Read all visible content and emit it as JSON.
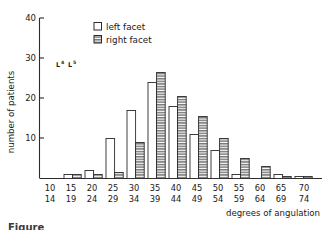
{
  "figure": {
    "background": "#ffffff",
    "ink_color": "#1a1a1a",
    "caption_fragment": "Figure"
  },
  "legend": {
    "position": "top-left-inner",
    "entries": [
      {
        "label": "left facet",
        "swatch": "open-square",
        "fill": "#ffffff"
      },
      {
        "label": "right facet",
        "swatch": "hatched-square",
        "fill": "#808080"
      }
    ]
  },
  "annotation": {
    "text": "L4 L5",
    "parts": [
      {
        "base": "L",
        "sup": "4"
      },
      {
        "base": "L",
        "sup": "5"
      }
    ]
  },
  "axes": {
    "y": {
      "label": "number of patients",
      "ticks": [
        10,
        20,
        30,
        40
      ],
      "tick_labels": [
        "10",
        "20",
        "30",
        "40"
      ],
      "min": 0,
      "max": 40
    },
    "x": {
      "label": "degrees of angulation",
      "tick_labels_top": [
        "10",
        "15",
        "20",
        "25",
        "30",
        "35",
        "40",
        "45",
        "50",
        "55",
        "60",
        "65",
        "70"
      ],
      "tick_labels_bottom": [
        "14",
        "19",
        "24",
        "29",
        "34",
        "39",
        "44",
        "49",
        "54",
        "59",
        "64",
        "69",
        "74"
      ]
    }
  },
  "chart_data": {
    "type": "bar",
    "title": "",
    "subtitle": "",
    "xlabel": "degrees of angulation",
    "ylabel": "number of patients",
    "ylim": [
      0,
      40
    ],
    "yticks": [
      10,
      20,
      30,
      40
    ],
    "grid": false,
    "legend_position": "upper left (inside axes)",
    "categories": [
      "10-14",
      "15-19",
      "20-24",
      "25-29",
      "30-34",
      "35-39",
      "40-44",
      "45-49",
      "50-54",
      "55-59",
      "60-64",
      "65-69",
      "70-74"
    ],
    "series": [
      {
        "name": "left facet",
        "fill": "#ffffff",
        "values": [
          0,
          1,
          2,
          10,
          17,
          24,
          18,
          11,
          7,
          1,
          0,
          1,
          0.5
        ]
      },
      {
        "name": "right facet",
        "fill": "#808080",
        "values": [
          0,
          1,
          1,
          1.5,
          9,
          26.5,
          20.5,
          15.5,
          10,
          5,
          3,
          0.5,
          0.5
        ]
      }
    ],
    "annotations": [
      {
        "text": "L4 L5",
        "x": "20-24",
        "y": 29
      }
    ]
  }
}
